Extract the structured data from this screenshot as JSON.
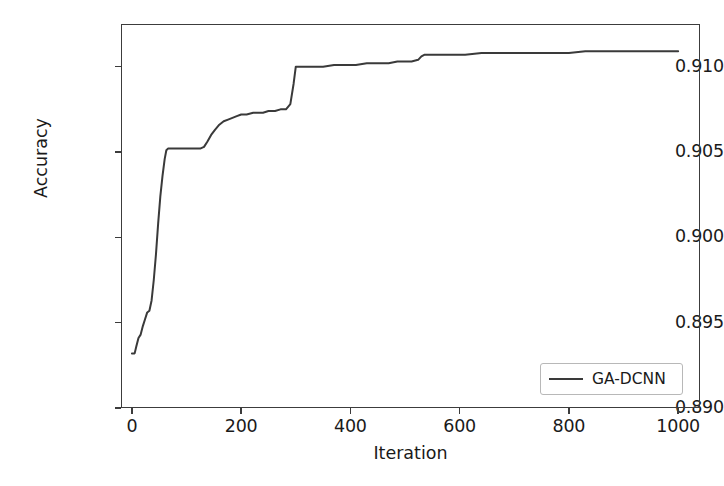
{
  "chart_data": {
    "type": "line",
    "title": "",
    "xlabel": "Iteration",
    "ylabel": "Accuracy",
    "xlim": [
      -20,
      1040
    ],
    "ylim": [
      0.89,
      0.9125
    ],
    "grid": false,
    "legend_position": "lower right",
    "xticks": [
      0,
      200,
      400,
      600,
      800,
      1000
    ],
    "xtick_labels": [
      "0",
      "200",
      "400",
      "600",
      "800",
      "1000"
    ],
    "yticks": [
      0.89,
      0.895,
      0.9,
      0.905,
      0.91
    ],
    "ytick_labels": [
      "0.890",
      "0.895",
      "0.900",
      "0.905",
      "0.910"
    ],
    "line_color": "#3a3a3a",
    "line_width": 2.0,
    "series": [
      {
        "name": "GA-DCNN",
        "color": "#3a3a3a",
        "x": [
          0,
          5,
          8,
          12,
          16,
          20,
          24,
          28,
          32,
          36,
          40,
          44,
          48,
          52,
          56,
          60,
          63,
          66,
          70,
          80,
          95,
          110,
          125,
          132,
          138,
          145,
          152,
          160,
          168,
          176,
          184,
          192,
          200,
          210,
          222,
          232,
          240,
          250,
          262,
          272,
          282,
          290,
          296,
          300,
          312,
          330,
          350,
          370,
          392,
          410,
          430,
          450,
          470,
          486,
          500,
          512,
          524,
          530,
          536,
          545,
          560,
          580,
          610,
          640,
          680,
          720,
          760,
          800,
          830,
          850,
          880,
          920,
          960,
          1000
        ],
        "y": [
          0.8932,
          0.8932,
          0.8936,
          0.8941,
          0.8943,
          0.8948,
          0.8952,
          0.8956,
          0.8957,
          0.8963,
          0.8975,
          0.899,
          0.9008,
          0.9024,
          0.9036,
          0.9046,
          0.9051,
          0.9052,
          0.9052,
          0.9052,
          0.9052,
          0.9052,
          0.9052,
          0.9053,
          0.9056,
          0.906,
          0.9063,
          0.9066,
          0.9068,
          0.9069,
          0.907,
          0.9071,
          0.9072,
          0.9072,
          0.9073,
          0.9073,
          0.9073,
          0.9074,
          0.9074,
          0.9075,
          0.9075,
          0.9078,
          0.909,
          0.91,
          0.91,
          0.91,
          0.91,
          0.9101,
          0.9101,
          0.9101,
          0.9102,
          0.9102,
          0.9102,
          0.9103,
          0.9103,
          0.9103,
          0.9104,
          0.9106,
          0.9107,
          0.9107,
          0.9107,
          0.9107,
          0.9107,
          0.9108,
          0.9108,
          0.9108,
          0.9108,
          0.9108,
          0.9109,
          0.9109,
          0.9109,
          0.9109,
          0.9109,
          0.9109
        ]
      }
    ]
  },
  "legend": {
    "entries": [
      {
        "label": "GA-DCNN",
        "color": "#3a3a3a"
      }
    ]
  }
}
